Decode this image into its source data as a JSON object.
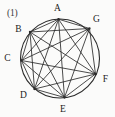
{
  "figure": {
    "number_label": "(1)",
    "number_label_pos": {
      "x": 7,
      "y": 9
    },
    "caption": "",
    "canvas": {
      "width": 115,
      "height": 117
    },
    "background_color": "#fbfbfa",
    "stroke_color": "#2b2b2b",
    "circle": {
      "cx": 60,
      "cy": 58.5,
      "r": 39.5,
      "stroke_width": 1.1
    },
    "chord_stroke_width": 0.85
  },
  "graph": {
    "name": "complete-graph-K7",
    "vertex_count": 7,
    "edge_count": 21,
    "vertices": [
      {
        "id": "A",
        "cx": 58.5,
        "cy": 19.2,
        "label": "A",
        "label_x": 57.5,
        "label_y": 8.5
      },
      {
        "id": "B",
        "cx": 30.0,
        "cy": 32.0,
        "label": "B",
        "label_x": 18.5,
        "label_y": 29.5
      },
      {
        "id": "C",
        "cx": 21.4,
        "cy": 60.5,
        "label": "C",
        "label_x": 7.5,
        "label_y": 58.5
      },
      {
        "id": "D",
        "cx": 34.5,
        "cy": 89.0,
        "label": "D",
        "label_x": 23.5,
        "label_y": 95.5
      },
      {
        "id": "E",
        "cx": 64.5,
        "cy": 97.5,
        "label": "E",
        "label_x": 63.0,
        "label_y": 110.0
      },
      {
        "id": "F",
        "cx": 95.5,
        "cy": 74.0,
        "label": "F",
        "label_x": 105.5,
        "label_y": 79.5
      },
      {
        "id": "G",
        "cx": 89.5,
        "cy": 28.5,
        "label": "G",
        "label_x": 96.5,
        "label_y": 19.5
      }
    ],
    "edges": [
      [
        "A",
        "B"
      ],
      [
        "A",
        "C"
      ],
      [
        "A",
        "D"
      ],
      [
        "A",
        "E"
      ],
      [
        "A",
        "F"
      ],
      [
        "A",
        "G"
      ],
      [
        "B",
        "C"
      ],
      [
        "B",
        "D"
      ],
      [
        "B",
        "E"
      ],
      [
        "B",
        "F"
      ],
      [
        "B",
        "G"
      ],
      [
        "C",
        "D"
      ],
      [
        "C",
        "E"
      ],
      [
        "C",
        "F"
      ],
      [
        "C",
        "G"
      ],
      [
        "D",
        "E"
      ],
      [
        "D",
        "F"
      ],
      [
        "D",
        "G"
      ],
      [
        "E",
        "F"
      ],
      [
        "E",
        "G"
      ],
      [
        "F",
        "G"
      ]
    ]
  }
}
